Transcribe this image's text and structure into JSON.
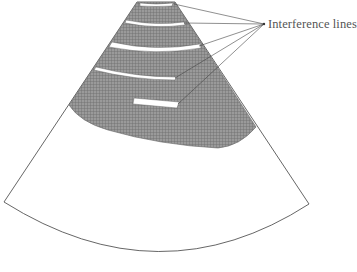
{
  "diagram": {
    "annotation": {
      "label": "Interference lines",
      "pointer_count": 5
    },
    "regions": [
      {
        "name": "shaded-near-field",
        "fill": "#8a8a8a",
        "pattern": "crosshatch"
      },
      {
        "name": "clear-far-field",
        "fill": "#ffffff"
      }
    ],
    "interference_lines": [
      {
        "index": 1,
        "position": "top-edge"
      },
      {
        "index": 2,
        "position": "upper-band"
      },
      {
        "index": 3,
        "position": "middle-band"
      },
      {
        "index": 4,
        "position": "lower-band"
      },
      {
        "index": 5,
        "position": "short-bar"
      }
    ],
    "colors": {
      "outline": "#555555",
      "shade": "#8a8a8a",
      "leader": "#444444",
      "background": "#ffffff"
    }
  }
}
